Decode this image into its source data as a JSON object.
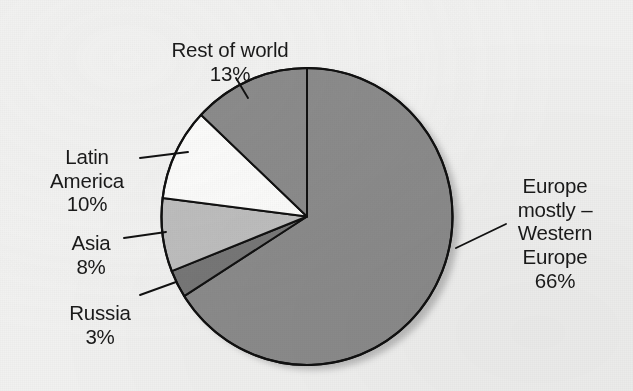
{
  "chart_data": {
    "type": "pie",
    "title": "",
    "subtitle": "",
    "units": "percent",
    "total": 100,
    "start_angle_deg": 0,
    "direction": "clockwise",
    "legend": "none (direct labels with leader lines)",
    "categories": [
      "Europe mostly – Western Europe",
      "Russia",
      "Asia",
      "Latin America",
      "Rest of world"
    ],
    "values": [
      66,
      3,
      8,
      10,
      13
    ],
    "slices": [
      {
        "key": "europe",
        "name": "Europe mostly – Western Europe",
        "label_text": "Europe\nmostly –\nWestern\nEurope",
        "value": 66,
        "value_label": "66%",
        "color": "#8b8b8b",
        "start_deg": 0,
        "end_deg": 237.6
      },
      {
        "key": "russia",
        "name": "Russia",
        "label_text": "Russia",
        "value": 3,
        "value_label": "3%",
        "color": "#777777",
        "start_deg": 237.6,
        "end_deg": 248.4
      },
      {
        "key": "asia",
        "name": "Asia",
        "label_text": "Asia",
        "value": 8,
        "value_label": "8%",
        "color": "#bdbdbd",
        "start_deg": 248.4,
        "end_deg": 277.2
      },
      {
        "key": "latin_america",
        "name": "Latin America",
        "label_text": "Latin\nAmerica",
        "value": 10,
        "value_label": "10%",
        "color": "#fbfbfa",
        "start_deg": 277.2,
        "end_deg": 313.2
      },
      {
        "key": "rest_of_world",
        "name": "Rest of world",
        "label_text": "Rest of world",
        "value": 13,
        "value_label": "13%",
        "color": "#8b8b8b",
        "start_deg": 313.2,
        "end_deg": 360
      }
    ]
  },
  "style": {
    "background_color": "#f1f1f0",
    "outline_color": "#111111",
    "text_color": "#1a1a1a",
    "shadow_color": "#b9b9b9"
  }
}
